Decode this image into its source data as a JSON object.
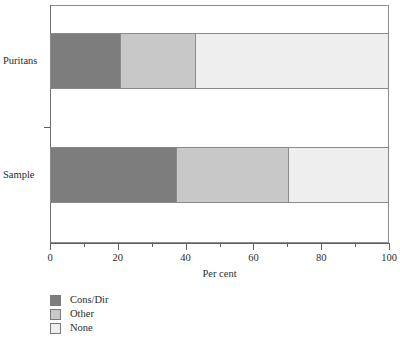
{
  "chart_data": {
    "type": "bar",
    "orientation": "horizontal",
    "stacked": true,
    "title": "",
    "xlabel": "Per cent",
    "ylabel": "",
    "xlim": [
      0,
      100
    ],
    "xticks": [
      0,
      20,
      40,
      60,
      80,
      100
    ],
    "xtick_labels": [
      "0",
      "20",
      "40",
      "60",
      "80",
      "100"
    ],
    "minor_xticks": [
      10,
      30,
      50,
      70,
      90
    ],
    "grid": false,
    "legend_position": "below-left",
    "categories": [
      "Puritans",
      "Sample"
    ],
    "series": [
      {
        "name": "Cons/Dir",
        "color": "#7d7d7d",
        "values": [
          21,
          37.5
        ]
      },
      {
        "name": "Other",
        "color": "#c8c8c8",
        "values": [
          22,
          33
        ]
      },
      {
        "name": "None",
        "color": "#eeeeee",
        "values": [
          57,
          29.5
        ]
      }
    ],
    "cumulative_boundaries": {
      "Puritans": [
        0,
        21,
        43,
        100
      ],
      "Sample": [
        0,
        37.5,
        70.5,
        100
      ]
    }
  },
  "axis": {
    "x_title": "Per cent",
    "tick_labels": [
      "0",
      "20",
      "40",
      "60",
      "80",
      "100"
    ],
    "category_labels": [
      "Puritans",
      "Sample"
    ]
  },
  "legend": {
    "items": [
      {
        "label": "Cons/Dir",
        "color": "#7d7d7d"
      },
      {
        "label": "Other",
        "color": "#c8c8c8"
      },
      {
        "label": "None",
        "color": "#eeeeee"
      }
    ]
  },
  "colors": {
    "cons_dir": "#7d7d7d",
    "other": "#c8c8c8",
    "none": "#eeeeee",
    "frame": "#8d8d8d",
    "axis": "#5f5f5f",
    "text": "#2b2b2b",
    "background": "#ffffff"
  }
}
